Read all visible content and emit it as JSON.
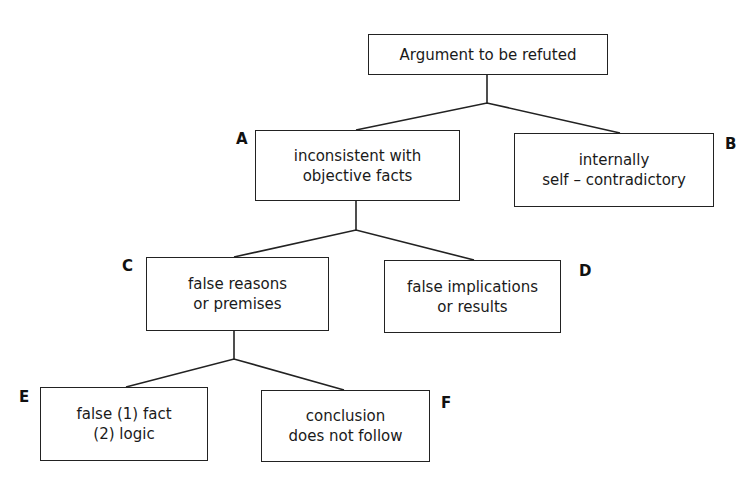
{
  "diagram": {
    "type": "tree",
    "root": {
      "id": "root",
      "text": "Argument to be refuted"
    },
    "nodes": [
      {
        "id": "A",
        "letter": "A",
        "text": "inconsistent with\nobjective facts",
        "parent": "root"
      },
      {
        "id": "B",
        "letter": "B",
        "text": "internally\nself – contradictory",
        "parent": "root"
      },
      {
        "id": "C",
        "letter": "C",
        "text": "false reasons\nor premises",
        "parent": "A"
      },
      {
        "id": "D",
        "letter": "D",
        "text": "false implications\nor results",
        "parent": "A"
      },
      {
        "id": "E",
        "letter": "E",
        "text": "false (1) fact\n(2) logic",
        "parent": "C"
      },
      {
        "id": "F",
        "letter": "F",
        "text": "conclusion\ndoes not follow",
        "parent": "C"
      }
    ],
    "colors": {
      "line": "#222222",
      "background": "#ffffff",
      "text": "#1a1a1a"
    }
  }
}
